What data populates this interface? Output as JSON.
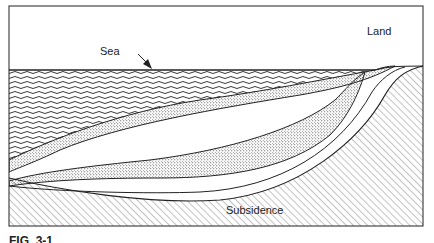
{
  "diagram": {
    "type": "geological cross-section",
    "labels": {
      "sea": "Sea",
      "land": "Land",
      "subsidence": "Subsidence"
    },
    "caption": "FIG. 3-1",
    "layers": [
      {
        "name": "sea-water",
        "pattern": "wavy-lines"
      },
      {
        "name": "upper-sediment-wedge",
        "pattern": "stipple"
      },
      {
        "name": "intermediate-layer",
        "pattern": "blank"
      },
      {
        "name": "lower-sediment-wedge",
        "pattern": "stipple"
      },
      {
        "name": "basement",
        "pattern": "diagonal-hatch"
      }
    ],
    "colors": {
      "line": "#222222",
      "background": "#ffffff",
      "hatch": "#555555"
    }
  }
}
